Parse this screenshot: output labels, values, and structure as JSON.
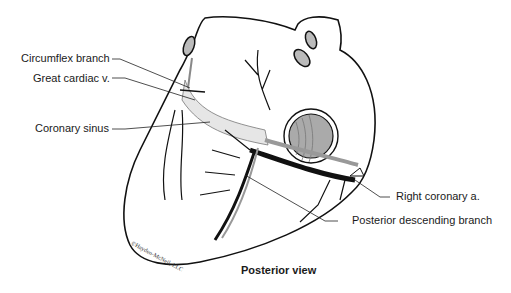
{
  "diagram": {
    "title": "Posterior view",
    "labels": [
      {
        "id": "circumflex",
        "text": "Circumflex branch"
      },
      {
        "id": "great_cardiac",
        "text": "Great cardiac v."
      },
      {
        "id": "coronary_sinus",
        "text": "Coronary sinus"
      },
      {
        "id": "right_coronary",
        "text": "Right coronary a."
      },
      {
        "id": "posterior_descending",
        "text": "Posterior descending branch"
      }
    ],
    "credit": "©Hayden-McNeil, LLC"
  }
}
